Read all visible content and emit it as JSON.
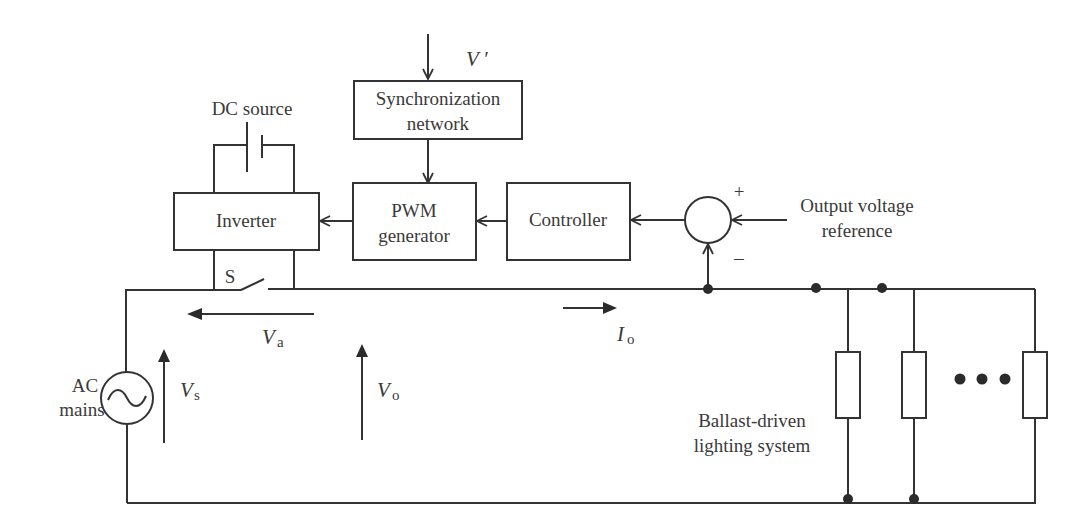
{
  "diagram": {
    "blocks": {
      "sync": {
        "line1": "Synchronization",
        "line2": "network"
      },
      "inverter": {
        "label": "Inverter"
      },
      "pwm": {
        "line1": "PWM",
        "line2": "generator"
      },
      "controller": {
        "label": "Controller"
      }
    },
    "labels": {
      "v_prime": "V ′",
      "dc_source": "DC source",
      "switch": "S",
      "output_ref_line1": "Output voltage",
      "output_ref_line2": "reference",
      "plus": "+",
      "minus": "–",
      "ac_line1": "AC",
      "ac_line2": "mains",
      "lighting_line1": "Ballast-driven",
      "lighting_line2": "lighting system"
    },
    "quantities": {
      "va": {
        "main": "V",
        "sub": "a"
      },
      "vs": {
        "main": "V",
        "sub": "s"
      },
      "vo": {
        "main": "V",
        "sub": "o"
      },
      "io": {
        "main": "I",
        "sub": "o"
      }
    },
    "colors": {
      "line": "#333333",
      "text": "#3a3a3a",
      "background": "#ffffff"
    }
  }
}
